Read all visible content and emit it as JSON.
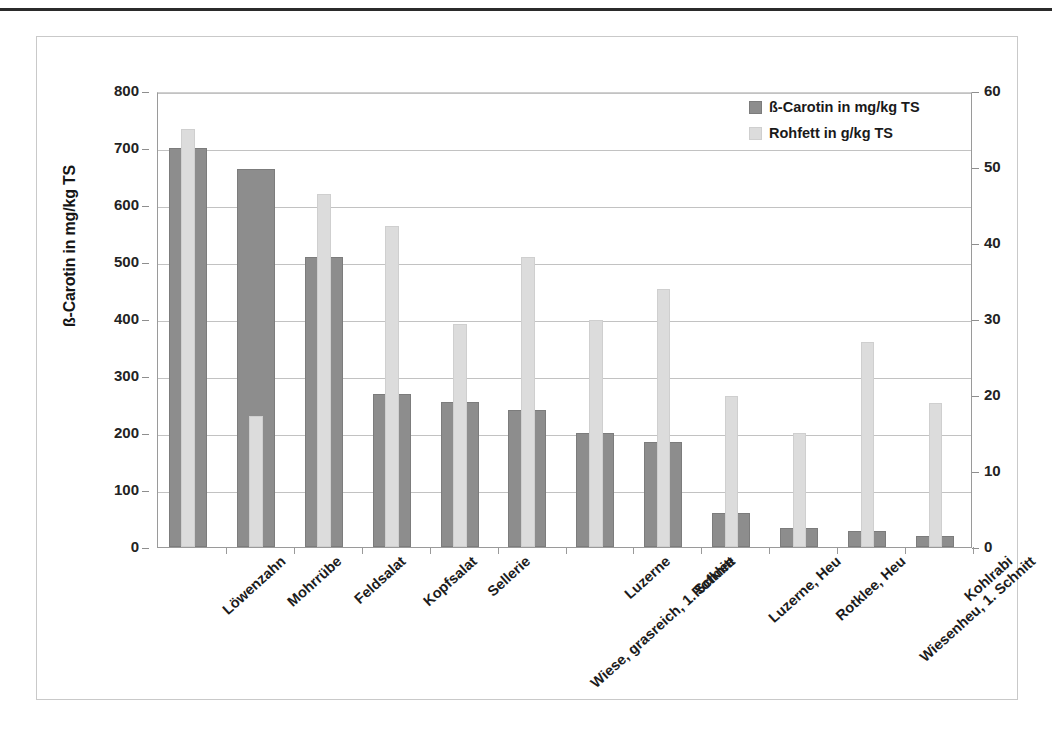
{
  "chart_data": {
    "type": "bar",
    "title": "",
    "categories": [
      "Löwenzahn",
      "Mohrrübe",
      "Feldsalat",
      "Kopfsalat",
      "Sellerie",
      "Wiese, grasreich, 1. Schnitt",
      "Luzerne",
      "Rotklee",
      "Luzerne, Heu",
      "Rotklee, Heu",
      "Wiesenheu, 1. Schnitt",
      "Kohlrabi"
    ],
    "series": [
      {
        "name": "ß-Carotin in mg/kg TS",
        "axis": "left",
        "color": "#8d8d8d",
        "values": [
          700,
          663,
          508,
          268,
          255,
          240,
          200,
          185,
          60,
          33,
          28,
          20
        ]
      },
      {
        "name": "Rohfett in g/kg TS",
        "axis": "right",
        "color": "#dcdcdc",
        "values": [
          55.0,
          17.3,
          46.5,
          42.2,
          29.3,
          38.1,
          29.9,
          33.9,
          19.9,
          15.0,
          27.0,
          18.9
        ]
      }
    ],
    "xlabel": "",
    "ylabel": "ß-Carotin in mg/kg TS",
    "y2label": "Rohfett in g/kg TS",
    "ylim": [
      0,
      800
    ],
    "y2lim": [
      0,
      60
    ],
    "yticks": [
      0,
      100,
      200,
      300,
      400,
      500,
      600,
      700,
      800
    ],
    "y2ticks": [
      0,
      10,
      20,
      30,
      40,
      50,
      60
    ],
    "grid": true,
    "legend_position": "top-right"
  },
  "axes": {
    "left": {
      "title": "ß-Carotin in mg/kg TS",
      "ticks": [
        "800",
        "700",
        "600",
        "500",
        "400",
        "300",
        "200",
        "100",
        "0"
      ]
    },
    "right": {
      "title": "Rohfett in g/kg TS",
      "ticks": [
        "60",
        "50",
        "40",
        "30",
        "20",
        "10",
        "0"
      ]
    }
  },
  "legend": {
    "items": [
      {
        "label": "ß-Carotin in mg/kg TS",
        "swatch": "dark"
      },
      {
        "label": "Rohfett in g/kg TS",
        "swatch": "light"
      }
    ]
  }
}
